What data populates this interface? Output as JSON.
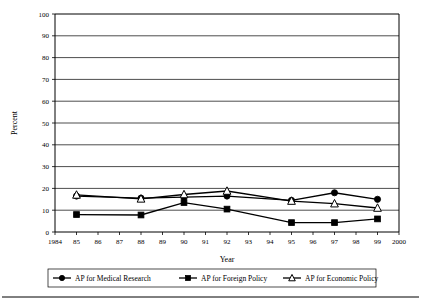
{
  "chart_data": {
    "type": "line",
    "title": "",
    "xlabel": "Year",
    "ylabel": "Percent",
    "xlim": [
      1984,
      2000
    ],
    "ylim": [
      0,
      100
    ],
    "grid": true,
    "legend_position": "bottom",
    "ytick_labels": [
      "0",
      "10",
      "20",
      "30",
      "40",
      "50",
      "60",
      "70",
      "80",
      "90",
      "100"
    ],
    "ytick_values": [
      0,
      10,
      20,
      30,
      40,
      50,
      60,
      70,
      80,
      90,
      100
    ],
    "xtick_labels": [
      "1984",
      "85",
      "86",
      "87",
      "88",
      "89",
      "90",
      "91",
      "92",
      "93",
      "94",
      "95",
      "96",
      "97",
      "98",
      "99",
      "2000"
    ],
    "xtick_values": [
      1984,
      1985,
      1986,
      1987,
      1988,
      1989,
      1990,
      1991,
      1992,
      1993,
      1994,
      1995,
      1996,
      1997,
      1998,
      1999,
      2000
    ],
    "x": [
      1985,
      1988,
      1990,
      1992,
      1995,
      1997,
      1999
    ],
    "series": [
      {
        "name": "AP for Medical Research",
        "marker": "filled-circle",
        "color": "#000000",
        "values": [
          16.5,
          15.5,
          16,
          16.5,
          14.5,
          18,
          15
        ]
      },
      {
        "name": "AP for Foreign Policy",
        "marker": "filled-square",
        "color": "#000000",
        "values": [
          8,
          7.8,
          13.5,
          10.5,
          4.3,
          4.3,
          6
        ]
      },
      {
        "name": "AP for Economic Policy",
        "marker": "open-triangle",
        "color": "#000000",
        "values": [
          17,
          15.2,
          17.2,
          18.8,
          14.2,
          13,
          11
        ]
      }
    ]
  },
  "legend": {
    "items": [
      {
        "label": "AP for Medical Research",
        "marker": "filled-circle"
      },
      {
        "label": "AP for Foreign Policy",
        "marker": "filled-square"
      },
      {
        "label": "AP for Economic Policy",
        "marker": "open-triangle"
      }
    ]
  }
}
